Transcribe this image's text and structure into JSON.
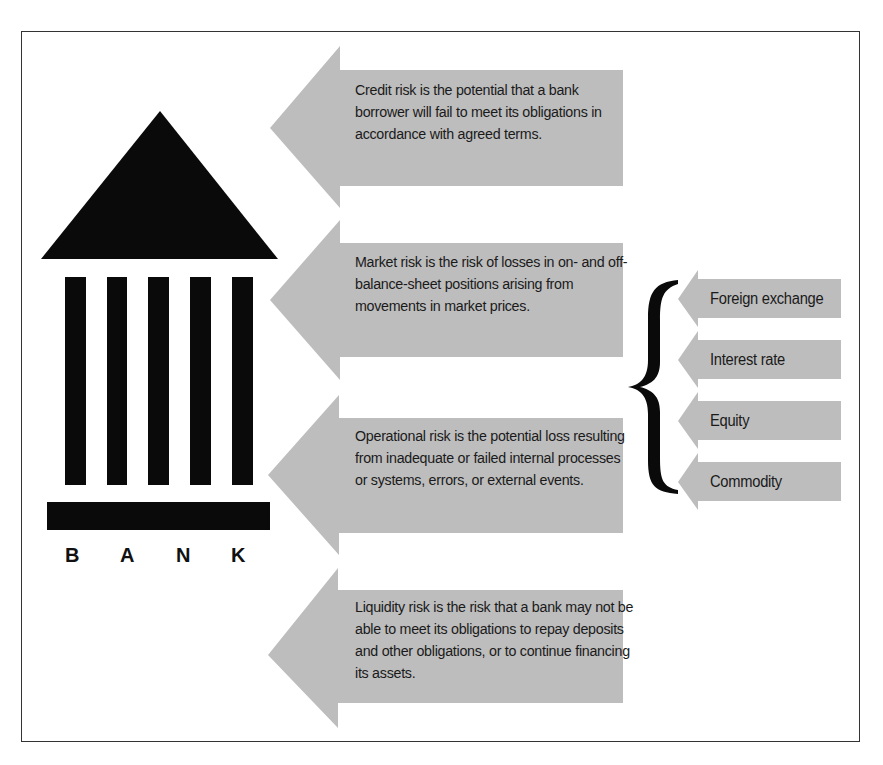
{
  "bank_icon": {
    "label_letters": [
      "B",
      "A",
      "N",
      "K"
    ],
    "column_count": 5
  },
  "risks": [
    {
      "name": "credit-risk",
      "text": "Credit risk is the potential that a bank borrower will fail to meet its obligations in accordance with agreed terms."
    },
    {
      "name": "market-risk",
      "text": "Market risk is the risk of losses in on- and off-balance-sheet positions arising from movements in market prices."
    },
    {
      "name": "operational-risk",
      "text": "Operational risk is the potential loss resulting from inadequate or failed internal processes or systems, errors, or external events."
    },
    {
      "name": "liquidity-risk",
      "text": "Liquidity risk is the risk that a bank may not be able to meet its obligations to repay deposits and other obligations, or to continue financing its assets."
    }
  ],
  "market_risk_types": [
    {
      "label": "Foreign exchange"
    },
    {
      "label": "Interest rate"
    },
    {
      "label": "Equity"
    },
    {
      "label": "Commodity"
    }
  ],
  "colors": {
    "arrow_fill": "#bdbdbd",
    "bank_fill": "#0a0a0a",
    "border": "#333333"
  }
}
